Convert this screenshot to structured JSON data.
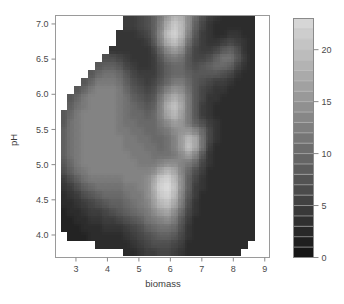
{
  "figure": {
    "kind": "filled-contour",
    "background": "#ffffff",
    "nodata_color": "#ffffff"
  },
  "chart_data": {
    "type": "heatmap",
    "title": "",
    "subtitle": "",
    "xlabel": "biomass",
    "ylabel": "pH",
    "xlim": [
      2.35,
      9.15
    ],
    "ylim": [
      3.68,
      7.12
    ],
    "xticks": [
      3,
      4,
      5,
      6,
      7,
      8,
      9
    ],
    "xticklabels": [
      "3",
      "4",
      "5",
      "6",
      "7",
      "8",
      "9"
    ],
    "yticks": [
      4.0,
      4.5,
      5.0,
      5.5,
      6.0,
      6.5,
      7.0
    ],
    "yticklabels": [
      "4.0",
      "4.5",
      "5.0",
      "5.5",
      "6.0",
      "6.5",
      "7.0"
    ],
    "grid": false,
    "colormap": "grayscale",
    "zlim": [
      0,
      23
    ],
    "levels": [
      0,
      1,
      2,
      3,
      4,
      5,
      6,
      7,
      8,
      9,
      10,
      11,
      12,
      13,
      14,
      15,
      16,
      17,
      18,
      19,
      20,
      21,
      22,
      23
    ],
    "colorbar": {
      "position": "right",
      "ticks": [
        0,
        5,
        10,
        15,
        20
      ],
      "ticklabels": [
        "0",
        "5",
        "10",
        "15",
        "20"
      ],
      "vmin": 0,
      "vmax": 23,
      "band_count": 23
    },
    "z_description": "Response surface over biomass and pH; bright peaks near (6.0, 6.85), (5.8, 4.8), (6.3, 5.7) and (6.6, 5.35); dark low-value regions in the lower-left, upper-centre and across the right-hand side; data masked to an irregular hull leaving white corners.",
    "grid_x": [
      2.4,
      2.62,
      2.84,
      3.06,
      3.28,
      3.5,
      3.72,
      3.94,
      4.16,
      4.38,
      4.6,
      4.82,
      5.04,
      5.26,
      5.48,
      5.7,
      5.92,
      6.14,
      6.36,
      6.58,
      6.8,
      7.02,
      7.24,
      7.46,
      7.68,
      7.9,
      8.12,
      8.34,
      8.56,
      8.78,
      9.1
    ],
    "grid_y": [
      7.1,
      6.98,
      6.86,
      6.75,
      6.63,
      6.52,
      6.4,
      6.29,
      6.17,
      6.06,
      5.94,
      5.83,
      5.71,
      5.6,
      5.48,
      5.37,
      5.25,
      5.14,
      5.02,
      4.91,
      4.79,
      4.68,
      4.56,
      4.45,
      4.33,
      4.22,
      4.1,
      3.99,
      3.87,
      3.76
    ],
    "z": [
      [
        null,
        null,
        null,
        null,
        null,
        null,
        null,
        null,
        null,
        null,
        5,
        5,
        6,
        7,
        9,
        12,
        16,
        19,
        18,
        14,
        10,
        7,
        5,
        4,
        3,
        3,
        3,
        3,
        3,
        null
      ],
      [
        null,
        null,
        null,
        null,
        null,
        null,
        null,
        null,
        null,
        null,
        5,
        5,
        6,
        7,
        9,
        13,
        18,
        21,
        19,
        14,
        9,
        6,
        4,
        3,
        3,
        3,
        3,
        3,
        3,
        null
      ],
      [
        null,
        null,
        null,
        null,
        null,
        null,
        null,
        null,
        null,
        4,
        4,
        4,
        5,
        6,
        9,
        14,
        20,
        22,
        19,
        13,
        8,
        5,
        4,
        3,
        3,
        4,
        4,
        3,
        3,
        null
      ],
      [
        null,
        null,
        null,
        null,
        null,
        null,
        null,
        null,
        null,
        4,
        4,
        4,
        4,
        5,
        8,
        13,
        18,
        20,
        17,
        11,
        7,
        5,
        4,
        4,
        5,
        6,
        5,
        4,
        3,
        null
      ],
      [
        null,
        null,
        null,
        null,
        null,
        null,
        null,
        null,
        4,
        4,
        4,
        4,
        4,
        4,
        6,
        10,
        14,
        16,
        14,
        9,
        6,
        5,
        5,
        6,
        8,
        9,
        7,
        4,
        3,
        null
      ],
      [
        null,
        null,
        null,
        null,
        null,
        null,
        null,
        7,
        7,
        6,
        5,
        4,
        4,
        4,
        5,
        8,
        11,
        12,
        11,
        8,
        6,
        6,
        7,
        9,
        11,
        11,
        8,
        5,
        3,
        null
      ],
      [
        null,
        null,
        null,
        null,
        null,
        null,
        8,
        9,
        9,
        8,
        6,
        5,
        4,
        4,
        5,
        7,
        9,
        10,
        10,
        8,
        7,
        8,
        9,
        10,
        10,
        9,
        6,
        4,
        3,
        null
      ],
      [
        null,
        null,
        null,
        null,
        null,
        8,
        10,
        11,
        11,
        10,
        8,
        6,
        5,
        5,
        5,
        7,
        9,
        10,
        10,
        9,
        8,
        8,
        8,
        8,
        7,
        6,
        4,
        3,
        3,
        null
      ],
      [
        null,
        null,
        null,
        null,
        8,
        10,
        12,
        12,
        12,
        11,
        9,
        7,
        6,
        5,
        6,
        8,
        10,
        12,
        12,
        10,
        8,
        7,
        6,
        5,
        5,
        4,
        3,
        3,
        3,
        null
      ],
      [
        null,
        null,
        null,
        8,
        10,
        12,
        13,
        13,
        13,
        12,
        10,
        8,
        7,
        6,
        7,
        10,
        13,
        15,
        14,
        11,
        8,
        6,
        5,
        4,
        4,
        3,
        3,
        3,
        3,
        null
      ],
      [
        null,
        null,
        8,
        10,
        12,
        13,
        13,
        13,
        13,
        12,
        11,
        9,
        8,
        7,
        8,
        12,
        16,
        18,
        16,
        12,
        8,
        6,
        4,
        4,
        3,
        3,
        3,
        3,
        3,
        null
      ],
      [
        null,
        null,
        9,
        11,
        12,
        13,
        13,
        13,
        13,
        12,
        11,
        10,
        9,
        8,
        9,
        13,
        18,
        20,
        17,
        12,
        8,
        5,
        4,
        3,
        3,
        3,
        3,
        3,
        3,
        null
      ],
      [
        null,
        8,
        10,
        12,
        13,
        13,
        13,
        13,
        13,
        12,
        11,
        10,
        10,
        9,
        10,
        13,
        17,
        19,
        16,
        12,
        8,
        5,
        4,
        3,
        3,
        3,
        3,
        3,
        3,
        null
      ],
      [
        null,
        8,
        11,
        12,
        13,
        13,
        13,
        13,
        13,
        12,
        11,
        11,
        10,
        10,
        10,
        12,
        14,
        16,
        15,
        12,
        9,
        7,
        5,
        4,
        3,
        3,
        3,
        3,
        3,
        null
      ],
      [
        null,
        9,
        11,
        12,
        13,
        13,
        13,
        13,
        13,
        12,
        12,
        11,
        11,
        10,
        10,
        11,
        12,
        14,
        15,
        15,
        13,
        10,
        6,
        4,
        3,
        3,
        3,
        3,
        3,
        null
      ],
      [
        null,
        9,
        11,
        12,
        13,
        13,
        13,
        13,
        13,
        13,
        12,
        12,
        11,
        11,
        10,
        10,
        11,
        13,
        16,
        19,
        17,
        11,
        6,
        4,
        3,
        3,
        3,
        3,
        3,
        null
      ],
      [
        null,
        9,
        11,
        12,
        13,
        13,
        13,
        13,
        13,
        13,
        12,
        12,
        12,
        11,
        11,
        10,
        11,
        13,
        16,
        20,
        17,
        11,
        5,
        3,
        3,
        3,
        3,
        3,
        3,
        null
      ],
      [
        null,
        9,
        11,
        12,
        13,
        13,
        13,
        13,
        13,
        13,
        13,
        12,
        12,
        12,
        11,
        11,
        11,
        12,
        14,
        16,
        13,
        8,
        4,
        3,
        3,
        3,
        3,
        3,
        3,
        null
      ],
      [
        null,
        8,
        10,
        12,
        13,
        13,
        13,
        13,
        13,
        13,
        13,
        13,
        12,
        12,
        12,
        13,
        14,
        14,
        13,
        12,
        10,
        6,
        4,
        3,
        3,
        3,
        3,
        3,
        3,
        null
      ],
      [
        null,
        7,
        9,
        11,
        12,
        13,
        13,
        13,
        13,
        13,
        13,
        13,
        13,
        13,
        14,
        17,
        19,
        17,
        13,
        10,
        7,
        5,
        3,
        3,
        3,
        3,
        3,
        3,
        3,
        null
      ],
      [
        null,
        5,
        7,
        9,
        11,
        12,
        12,
        12,
        12,
        12,
        13,
        13,
        13,
        14,
        17,
        21,
        22,
        19,
        14,
        9,
        6,
        4,
        3,
        3,
        3,
        3,
        3,
        3,
        3,
        null
      ],
      [
        null,
        4,
        5,
        7,
        9,
        10,
        11,
        11,
        11,
        11,
        12,
        12,
        13,
        14,
        18,
        22,
        23,
        20,
        14,
        9,
        5,
        4,
        3,
        3,
        3,
        3,
        3,
        3,
        3,
        null
      ],
      [
        null,
        3,
        4,
        5,
        7,
        8,
        9,
        10,
        10,
        10,
        11,
        12,
        12,
        14,
        17,
        21,
        22,
        19,
        13,
        8,
        5,
        3,
        3,
        3,
        3,
        3,
        3,
        3,
        3,
        null
      ],
      [
        null,
        3,
        3,
        4,
        5,
        6,
        7,
        8,
        9,
        9,
        10,
        11,
        12,
        13,
        16,
        19,
        20,
        17,
        12,
        7,
        4,
        3,
        3,
        3,
        3,
        3,
        3,
        3,
        3,
        null
      ],
      [
        null,
        2,
        3,
        3,
        4,
        5,
        5,
        6,
        7,
        8,
        9,
        10,
        11,
        12,
        14,
        16,
        17,
        14,
        10,
        6,
        4,
        3,
        3,
        3,
        3,
        3,
        3,
        3,
        3,
        null
      ],
      [
        null,
        2,
        2,
        3,
        3,
        4,
        4,
        5,
        5,
        6,
        7,
        8,
        9,
        11,
        12,
        13,
        14,
        12,
        8,
        5,
        3,
        3,
        3,
        3,
        3,
        3,
        3,
        3,
        3,
        null
      ],
      [
        null,
        2,
        2,
        2,
        3,
        3,
        3,
        4,
        4,
        4,
        5,
        6,
        7,
        9,
        10,
        11,
        11,
        10,
        7,
        4,
        3,
        3,
        3,
        3,
        3,
        3,
        3,
        3,
        3,
        null
      ],
      [
        null,
        null,
        2,
        2,
        2,
        3,
        3,
        3,
        3,
        3,
        4,
        5,
        6,
        7,
        8,
        9,
        9,
        8,
        6,
        4,
        3,
        3,
        3,
        3,
        3,
        3,
        3,
        3,
        3,
        null
      ],
      [
        null,
        null,
        null,
        null,
        null,
        null,
        3,
        3,
        3,
        3,
        3,
        4,
        5,
        6,
        7,
        7,
        7,
        6,
        5,
        3,
        3,
        3,
        3,
        3,
        3,
        3,
        3,
        3,
        null
      ],
      [
        null,
        null,
        null,
        null,
        null,
        null,
        null,
        null,
        null,
        null,
        3,
        3,
        4,
        5,
        5,
        6,
        6,
        5,
        4,
        3,
        3,
        3,
        3,
        3,
        3,
        3,
        3,
        null,
        null
      ]
    ]
  }
}
